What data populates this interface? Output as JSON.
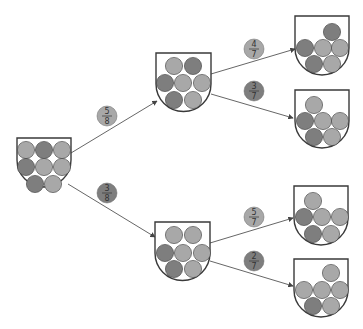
{
  "diagram": {
    "type": "probability-tree",
    "colors": {
      "light": "#a8a8a8",
      "dark": "#7e7e7e",
      "outline": "#3a3a3a",
      "background": "#ffffff"
    },
    "urns": {
      "root": {
        "balls": [
          "light",
          "dark",
          "light",
          "dark",
          "light",
          "light",
          "dark",
          "light"
        ]
      },
      "upper": {
        "balls": [
          "light",
          "dark",
          "dark",
          "light",
          "light",
          "dark",
          "light"
        ]
      },
      "lower": {
        "balls": [
          "light",
          "light",
          "dark",
          "light",
          "light",
          "dark",
          "light"
        ]
      },
      "upper_upper": {
        "balls": [
          "dark",
          "dark",
          "light",
          "light",
          "dark",
          "light"
        ]
      },
      "upper_lower": {
        "balls": [
          "light",
          "dark",
          "light",
          "light",
          "dark",
          "light"
        ]
      },
      "lower_upper": {
        "balls": [
          "light",
          "dark",
          "light",
          "light",
          "dark",
          "light"
        ]
      },
      "lower_lower": {
        "balls": [
          "light",
          "light",
          "light",
          "light",
          "dark",
          "light"
        ]
      }
    },
    "branches": {
      "root_upper": {
        "num": "5",
        "den": "8",
        "badge": "light"
      },
      "root_lower": {
        "num": "3",
        "den": "8",
        "badge": "dark"
      },
      "upper_upper": {
        "num": "4",
        "den": "7",
        "badge": "light"
      },
      "upper_lower": {
        "num": "3",
        "den": "7",
        "badge": "dark"
      },
      "lower_upper": {
        "num": "5",
        "den": "7",
        "badge": "light"
      },
      "lower_lower": {
        "num": "2",
        "den": "7",
        "badge": "dark"
      }
    }
  }
}
